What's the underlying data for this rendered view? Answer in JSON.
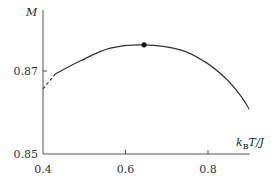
{
  "chart_data": {
    "type": "line",
    "title": "",
    "xlabel": "k_B T/J",
    "xlabel_main": "k",
    "xlabel_sub": "B",
    "xlabel_rest": "T/J",
    "ylabel": "M",
    "xlim": [
      0.4,
      0.92
    ],
    "ylim": [
      0.85,
      0.8785
    ],
    "x_ticks": [
      {
        "value": 0.4,
        "label": "0.4"
      },
      {
        "value": 0.6,
        "label": "0.6"
      },
      {
        "value": 0.8,
        "label": "0.8"
      }
    ],
    "y_ticks": [
      {
        "value": 0.85,
        "label": "0.85"
      },
      {
        "value": 0.87,
        "label": "0.87"
      }
    ],
    "grid": false,
    "legend": "none",
    "series": [
      {
        "name": "extrapolation",
        "style": "dashed",
        "x": [
          0.4,
          0.43
        ],
        "y": [
          0.8657,
          0.8693
        ]
      },
      {
        "name": "M(T)",
        "style": "solid",
        "x": [
          0.43,
          0.49,
          0.563,
          0.645,
          0.733,
          0.793,
          0.842,
          0.878,
          0.9
        ],
        "y": [
          0.8693,
          0.8724,
          0.8755,
          0.8763,
          0.8751,
          0.8722,
          0.8683,
          0.8642,
          0.8608
        ]
      }
    ],
    "markers": [
      {
        "name": "maximum",
        "x": 0.645,
        "y": 0.8763
      }
    ]
  }
}
